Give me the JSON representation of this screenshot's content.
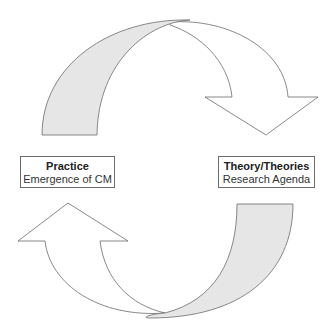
{
  "diagram": {
    "type": "cycle",
    "nodes": [
      {
        "id": "practice",
        "title": "Practice",
        "subtitle": "Emergence of CM",
        "position": "left"
      },
      {
        "id": "theory",
        "title": "Theory/Theories",
        "subtitle": "Research Agenda",
        "position": "right"
      }
    ],
    "edges": [
      {
        "from": "practice",
        "to": "theory",
        "shape": "curved-arrow-top",
        "direction": "clockwise"
      },
      {
        "from": "theory",
        "to": "practice",
        "shape": "curved-arrow-bottom",
        "direction": "clockwise"
      }
    ],
    "colors": {
      "arrow_fill": "#ffffff",
      "arrow_band_fill": "#e6e6e6",
      "stroke": "#6b6b6b"
    }
  }
}
